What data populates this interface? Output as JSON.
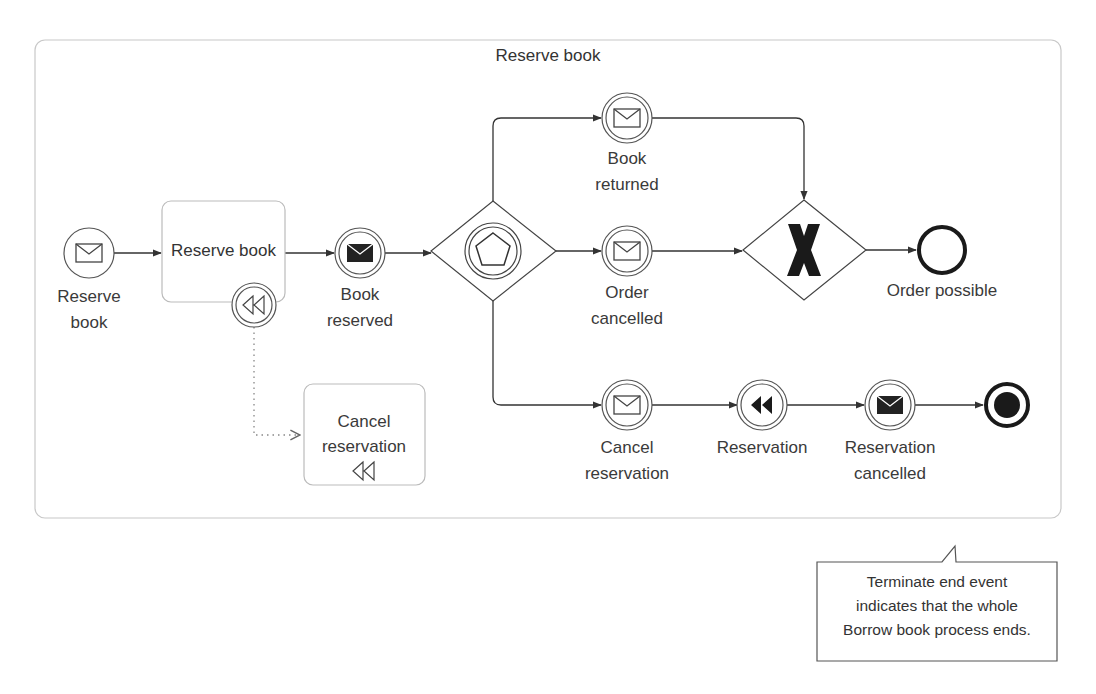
{
  "diagram": {
    "type": "BPMN",
    "subprocess": {
      "title": "Reserve book"
    },
    "nodes": {
      "start_event": {
        "kind": "message-start-event",
        "label_lines": [
          "Reserve",
          "book"
        ]
      },
      "task_reserve": {
        "kind": "task",
        "label": "Reserve book"
      },
      "boundary_compensation": {
        "kind": "compensation-boundary-event"
      },
      "task_cancel": {
        "kind": "compensation-task",
        "label_lines": [
          "Cancel",
          "reservation"
        ]
      },
      "book_reserved": {
        "kind": "message-throw-intermediate-event",
        "label_lines": [
          "Book",
          "reserved"
        ]
      },
      "event_gateway": {
        "kind": "event-based-gateway"
      },
      "book_returned": {
        "kind": "message-catch-intermediate-event",
        "label_lines": [
          "Book",
          "returned"
        ]
      },
      "order_cancelled": {
        "kind": "message-catch-intermediate-event",
        "label_lines": [
          "Order",
          "cancelled"
        ]
      },
      "cancel_reservation": {
        "kind": "message-catch-intermediate-event",
        "label_lines": [
          "Cancel",
          "reservation"
        ]
      },
      "xor_gateway": {
        "kind": "exclusive-gateway",
        "marker": "X"
      },
      "order_possible": {
        "kind": "end-event",
        "label": "Order possible"
      },
      "reservation": {
        "kind": "compensation-throw-intermediate-event",
        "label": "Reservation"
      },
      "reservation_cancelled": {
        "kind": "message-throw-intermediate-event",
        "label_lines": [
          "Reservation",
          "cancelled"
        ]
      },
      "terminate_end": {
        "kind": "terminate-end-event"
      }
    },
    "flows": [
      {
        "from": "start_event",
        "to": "task_reserve"
      },
      {
        "from": "task_reserve",
        "to": "book_reserved"
      },
      {
        "from": "book_reserved",
        "to": "event_gateway"
      },
      {
        "from": "event_gateway",
        "to": "book_returned"
      },
      {
        "from": "event_gateway",
        "to": "order_cancelled"
      },
      {
        "from": "event_gateway",
        "to": "cancel_reservation"
      },
      {
        "from": "book_returned",
        "to": "xor_gateway"
      },
      {
        "from": "order_cancelled",
        "to": "xor_gateway"
      },
      {
        "from": "xor_gateway",
        "to": "order_possible"
      },
      {
        "from": "cancel_reservation",
        "to": "reservation"
      },
      {
        "from": "reservation",
        "to": "reservation_cancelled"
      },
      {
        "from": "reservation_cancelled",
        "to": "terminate_end"
      },
      {
        "from": "boundary_compensation",
        "to": "task_cancel",
        "style": "association-dotted"
      }
    ],
    "annotation": {
      "lines": [
        "Terminate end event",
        "indicates that the whole",
        "Borrow book process ends."
      ]
    },
    "colors": {
      "stroke": "#333333",
      "container_border": "#c8c8c8",
      "task_border": "#bbbbbb",
      "text": "#333333",
      "background": "#ffffff"
    }
  }
}
